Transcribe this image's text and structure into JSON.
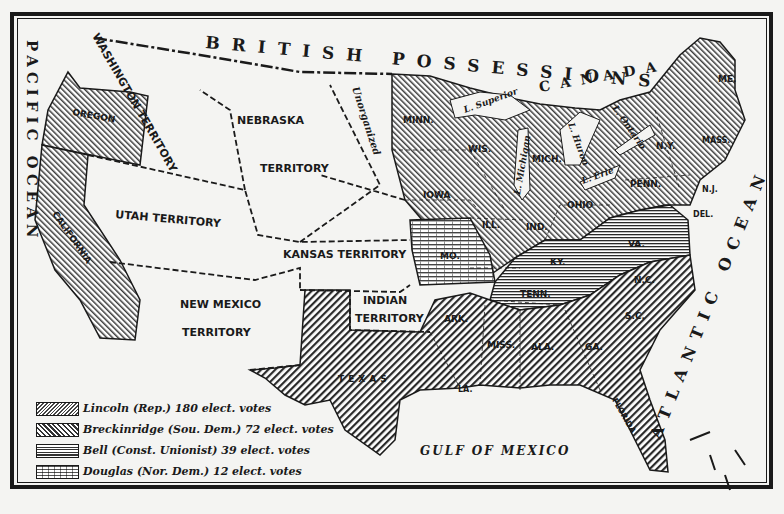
{
  "map": {
    "title": "Presidential Election of 1860",
    "regions": {
      "british_possessions": "BRITISH POSSESSIONS",
      "canada": "CANADA",
      "pacific_ocean": "PACIFIC OCEAN",
      "atlantic_ocean": "ATLANTIC OCEAN",
      "gulf_of_mexico": "GULF OF MEXICO"
    },
    "territories": {
      "washington": "WASHINGTON TERRITORY",
      "nebraska_1": "NEBRASKA",
      "nebraska_2": "TERRITORY",
      "unorganized": "Unorganized",
      "utah": "UTAH TERRITORY",
      "kansas": "KANSAS TERRITORY",
      "new_mexico_1": "NEW MEXICO",
      "new_mexico_2": "TERRITORY",
      "indian_1": "INDIAN",
      "indian_2": "TERRITORY"
    },
    "states": {
      "oregon": "OREGON",
      "california": "CALIFORNIA",
      "minn": "MINN.",
      "wis": "WIS.",
      "mich": "MICH.",
      "iowa": "IOWA",
      "ill": "ILL.",
      "ind": "IND.",
      "ohio": "OHIO",
      "penn": "PENN.",
      "ny": "N.Y.",
      "mass": "MASS.",
      "me": "ME.",
      "nj": "N.J.",
      "del": "DEL.",
      "md": "MD.",
      "va": "VA.",
      "ky": "KY.",
      "mo": "MO.",
      "tenn": "TENN.",
      "nc": "N.C.",
      "sc": "S.C.",
      "ga": "GA.",
      "ala": "ALA.",
      "miss": "MISS.",
      "ark": "ARK.",
      "la": "LA.",
      "texas": "TEXAS",
      "florida": "FLORIDA"
    },
    "lakes": {
      "superior": "L. Superior",
      "michigan": "L. Michigan",
      "huron": "L. Huron",
      "erie": "L. Erie",
      "ontario": "L. Ontario"
    }
  },
  "legend": {
    "items": [
      {
        "candidate": "Lincoln (Rep.) 180 elect. votes",
        "pattern": "diagonal-right"
      },
      {
        "candidate": "Breckinridge (Sou. Dem.) 72 elect. votes",
        "pattern": "diagonal-left"
      },
      {
        "candidate": "Bell (Const. Unionist) 39 elect. votes",
        "pattern": "horizontal"
      },
      {
        "candidate": "Douglas (Nor. Dem.) 12 elect. votes",
        "pattern": "brick"
      }
    ]
  },
  "colors": {
    "ink": "#1a1a1a",
    "paper": "#f4f4f2"
  }
}
